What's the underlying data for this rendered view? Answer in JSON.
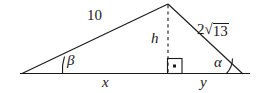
{
  "figure": {
    "kind": "geometry-diagram",
    "stroke_color": "#1a1a1a",
    "background_color": "#ffffff",
    "labels": {
      "left_side": "10",
      "altitude": "h",
      "right_side_coefficient": "2",
      "right_side_radical_sign": "√",
      "right_side_radicand": "13",
      "right_side_full": "2√13",
      "angle_left": "β",
      "angle_right": "α",
      "base_left_segment": "x",
      "base_right_segment": "y",
      "right_angle_marker": "·"
    },
    "geometry": {
      "vertex_left": [
        22,
        73.5
      ],
      "vertex_apex": [
        168,
        4
      ],
      "vertex_right": [
        243,
        74
      ],
      "foot_of_altitude": [
        168,
        73.5
      ],
      "right_angle_box": [
        167,
        58,
        15,
        15
      ],
      "altitude_style": "dashed",
      "base_style": "solid"
    }
  }
}
